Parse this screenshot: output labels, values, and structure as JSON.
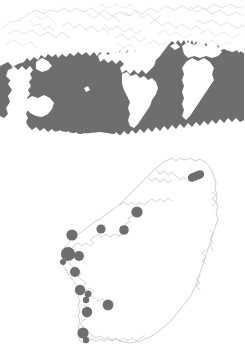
{
  "figure": {
    "background_color": "#ffffff",
    "width": 245,
    "height": 348,
    "panels": [
      {
        "id": "world-distribution-map",
        "name": "Global distribution map",
        "type": "map",
        "projection_extent": "world",
        "shaded_region_label": "Shaded global distribution range",
        "shaded_region_color": "#6e6e6e",
        "coastline_color": "#c9c9c9",
        "land_color": "#ffffff"
      },
      {
        "id": "ireland-sites-map",
        "name": "Ireland sampling site map",
        "type": "map",
        "projection_extent": "Ireland",
        "marker_label": "Sampling site",
        "marker_color": "#6e6e6e",
        "coastline_color": "#a8a8a8",
        "land_color": "#ffffff",
        "site_count": 16
      }
    ]
  },
  "chart_data": {
    "type": "map",
    "title": "",
    "subtitle": "",
    "maps": [
      {
        "name": "world-distribution",
        "kind": "choropleth-range",
        "legend": [
          {
            "label": "Distribution range",
            "color": "#6e6e6e"
          },
          {
            "label": "Land / outside range",
            "color": "#ffffff"
          }
        ],
        "annotations": []
      },
      {
        "name": "ireland-sampling-sites",
        "kind": "point-locations",
        "legend": [
          {
            "label": "Sampling site",
            "color": "#6e6e6e"
          }
        ],
        "points": [
          {
            "id": 1,
            "x": 196,
            "y": 176,
            "r": 4.2,
            "shape": "capsule",
            "rotation": -22,
            "length": 17
          },
          {
            "id": 2,
            "x": 137,
            "y": 212,
            "r": 5.6,
            "shape": "circle"
          },
          {
            "id": 3,
            "x": 124,
            "y": 230,
            "r": 4.8,
            "shape": "circle"
          },
          {
            "id": 4,
            "x": 101,
            "y": 229,
            "r": 4.6,
            "shape": "circle"
          },
          {
            "id": 5,
            "x": 72,
            "y": 235,
            "r": 5.6,
            "shape": "circle"
          },
          {
            "id": 6,
            "x": 68,
            "y": 254,
            "r": 7.1,
            "shape": "circle"
          },
          {
            "id": 7,
            "x": 79,
            "y": 256,
            "r": 5.0,
            "shape": "circle"
          },
          {
            "id": 8,
            "x": 75,
            "y": 272,
            "r": 5.0,
            "shape": "circle"
          },
          {
            "id": 9,
            "x": 80,
            "y": 290,
            "r": 5.2,
            "shape": "circle"
          },
          {
            "id": 10,
            "x": 88,
            "y": 294,
            "r": 3.4,
            "shape": "circle"
          },
          {
            "id": 11,
            "x": 86,
            "y": 300,
            "r": 3.2,
            "shape": "circle"
          },
          {
            "id": 12,
            "x": 108,
            "y": 305,
            "r": 5.4,
            "shape": "circle"
          },
          {
            "id": 13,
            "x": 87,
            "y": 312,
            "r": 5.2,
            "shape": "circle"
          },
          {
            "id": 14,
            "x": 83,
            "y": 333,
            "r": 5.6,
            "shape": "circle"
          },
          {
            "id": 15,
            "x": 86,
            "y": 340,
            "r": 3.2,
            "shape": "circle"
          },
          {
            "id": 16,
            "x": 63,
            "y": 262,
            "r": 3.0,
            "shape": "circle"
          }
        ],
        "annotations": []
      }
    ]
  }
}
